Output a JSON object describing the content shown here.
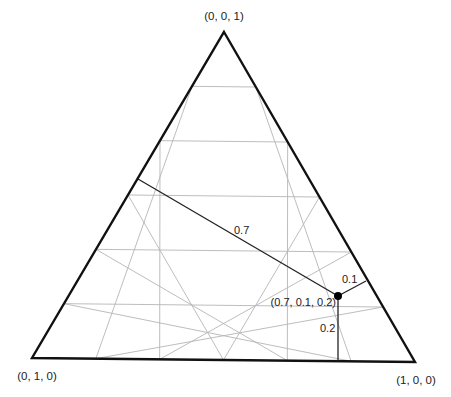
{
  "diagram": {
    "type": "ternary-plot",
    "grid_divisions": 6,
    "colors": {
      "frame": "#111111",
      "grid": "#b5b5b5",
      "guide": "#222222",
      "point": "#000000",
      "text": "#222222"
    },
    "vertices": {
      "top": {
        "label": "(0, 0, 1)",
        "x": 224,
        "y": 32
      },
      "left": {
        "label": "(0, 1, 0)",
        "x": 32,
        "y": 358
      },
      "right": {
        "label": "(1, 0, 0)",
        "x": 415,
        "y": 362
      }
    },
    "point": {
      "label": "(0.7, 0.1, 0.2)",
      "coords": [
        0.7,
        0.1,
        0.2
      ],
      "x": 338,
      "y": 296
    },
    "guides": [
      {
        "name": "guide-0.7",
        "label": "0.7",
        "to_x": 138,
        "to_y": 179,
        "label_x": 234,
        "label_y": 234
      },
      {
        "name": "guide-0.1",
        "label": "0.1",
        "to_x": 366,
        "to_y": 281,
        "label_x": 342,
        "label_y": 283
      },
      {
        "name": "guide-0.2",
        "label": "0.2",
        "to_x": 338,
        "to_y": 361,
        "label_x": 320,
        "label_y": 332
      }
    ]
  }
}
